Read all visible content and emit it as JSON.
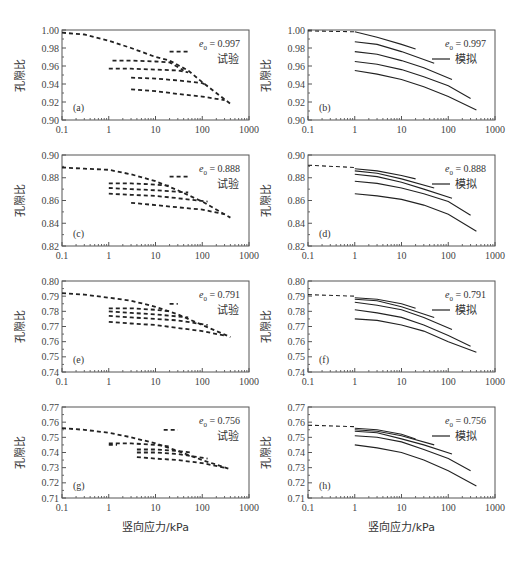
{
  "figure": {
    "x_axis_label": "竖向应力/kPa",
    "y_axis_label": "孔隙比"
  },
  "chart_data": [
    {
      "panel": "(a)",
      "type": "line",
      "style": "dashed",
      "legend": "试验",
      "e0_label": "e0 = 0.997",
      "xscale": "log",
      "xlim": [
        0.1,
        1000
      ],
      "xticks": [
        "0.1",
        "1",
        "10",
        "100",
        "1000"
      ],
      "ylim": [
        0.9,
        1.0
      ],
      "yticks": [
        "0.90",
        "0.92",
        "0.94",
        "0.96",
        "0.98",
        "1.00"
      ],
      "series": [
        {
          "name": "loading-0",
          "x": [
            0.1,
            0.3,
            1,
            3,
            10,
            20,
            50,
            100,
            200,
            400
          ],
          "y": [
            0.997,
            0.995,
            0.988,
            0.98,
            0.97,
            0.966,
            0.955,
            0.942,
            0.93,
            0.918
          ]
        },
        {
          "name": "reload-1",
          "x": [
            20,
            30,
            50
          ],
          "y": [
            0.976,
            0.976,
            0.976
          ]
        },
        {
          "name": "reload-2",
          "x": [
            1.2,
            3,
            10,
            20,
            40
          ],
          "y": [
            0.966,
            0.966,
            0.965,
            0.964,
            0.955
          ]
        },
        {
          "name": "reload-3",
          "x": [
            1,
            3,
            10,
            30,
            50
          ],
          "y": [
            0.957,
            0.957,
            0.956,
            0.955,
            0.953
          ]
        },
        {
          "name": "reload-4",
          "x": [
            3,
            10,
            30,
            100,
            130
          ],
          "y": [
            0.947,
            0.946,
            0.944,
            0.941,
            0.938
          ]
        },
        {
          "name": "reload-5",
          "x": [
            3,
            10,
            30,
            100,
            300
          ],
          "y": [
            0.934,
            0.932,
            0.929,
            0.926,
            0.922
          ]
        }
      ]
    },
    {
      "panel": "(b)",
      "type": "line",
      "style": "solid",
      "legend": "模拟",
      "e0_label": "e0 = 0.997",
      "xscale": "log",
      "xlim": [
        0.1,
        1000
      ],
      "ylim": [
        0.9,
        1.0
      ],
      "series": [
        {
          "name": "init",
          "x": [
            0.1,
            1
          ],
          "y": [
            0.999,
            0.998
          ]
        },
        {
          "name": "cycle-1",
          "x": [
            1,
            3,
            10,
            20
          ],
          "y": [
            0.998,
            0.992,
            0.984,
            0.979
          ]
        },
        {
          "name": "cycle-2",
          "x": [
            1,
            3,
            10,
            50
          ],
          "y": [
            0.987,
            0.984,
            0.976,
            0.963
          ]
        },
        {
          "name": "cycle-3",
          "x": [
            1,
            3,
            10,
            30,
            120
          ],
          "y": [
            0.976,
            0.973,
            0.966,
            0.958,
            0.945
          ]
        },
        {
          "name": "cycle-4",
          "x": [
            1,
            3,
            10,
            30,
            100,
            300
          ],
          "y": [
            0.965,
            0.962,
            0.956,
            0.948,
            0.938,
            0.924
          ]
        },
        {
          "name": "cycle-5",
          "x": [
            1,
            3,
            10,
            30,
            100,
            400
          ],
          "y": [
            0.955,
            0.951,
            0.945,
            0.937,
            0.926,
            0.911
          ]
        }
      ]
    },
    {
      "panel": "(c)",
      "type": "line",
      "style": "dashed",
      "legend": "试验",
      "e0_label": "e0 = 0.888",
      "xscale": "log",
      "xlim": [
        0.1,
        1000
      ],
      "ylim": [
        0.82,
        0.9
      ],
      "yticks": [
        "0.82",
        "0.84",
        "0.86",
        "0.88",
        "0.90"
      ],
      "series": [
        {
          "name": "loading-0",
          "x": [
            0.1,
            0.3,
            1,
            3,
            10,
            30,
            100,
            400
          ],
          "y": [
            0.889,
            0.888,
            0.887,
            0.883,
            0.877,
            0.869,
            0.859,
            0.845
          ]
        },
        {
          "name": "reload-1",
          "x": [
            20,
            30,
            50
          ],
          "y": [
            0.881,
            0.881,
            0.881
          ]
        },
        {
          "name": "reload-2",
          "x": [
            1,
            3,
            10,
            20
          ],
          "y": [
            0.875,
            0.875,
            0.874,
            0.873
          ]
        },
        {
          "name": "reload-3",
          "x": [
            1,
            3,
            10,
            50
          ],
          "y": [
            0.871,
            0.87,
            0.869,
            0.867
          ]
        },
        {
          "name": "reload-4",
          "x": [
            1,
            3,
            10,
            30,
            130
          ],
          "y": [
            0.866,
            0.865,
            0.864,
            0.862,
            0.859
          ]
        },
        {
          "name": "reload-5",
          "x": [
            3,
            10,
            30,
            100,
            300
          ],
          "y": [
            0.858,
            0.856,
            0.854,
            0.852,
            0.848
          ]
        }
      ]
    },
    {
      "panel": "(d)",
      "type": "line",
      "style": "solid",
      "legend": "模拟",
      "e0_label": "e0 = 0.888",
      "xscale": "log",
      "xlim": [
        0.1,
        1000
      ],
      "ylim": [
        0.82,
        0.9
      ],
      "series": [
        {
          "name": "init",
          "x": [
            0.1,
            1
          ],
          "y": [
            0.891,
            0.889
          ]
        },
        {
          "name": "cycle-1",
          "x": [
            1,
            3,
            10,
            20
          ],
          "y": [
            0.888,
            0.886,
            0.882,
            0.879
          ]
        },
        {
          "name": "cycle-2",
          "x": [
            1,
            3,
            10,
            50
          ],
          "y": [
            0.886,
            0.884,
            0.879,
            0.871
          ]
        },
        {
          "name": "cycle-3",
          "x": [
            1,
            3,
            10,
            30,
            120
          ],
          "y": [
            0.883,
            0.881,
            0.876,
            0.87,
            0.862
          ]
        },
        {
          "name": "cycle-4",
          "x": [
            1,
            3,
            10,
            30,
            100,
            300
          ],
          "y": [
            0.877,
            0.875,
            0.871,
            0.866,
            0.859,
            0.847
          ]
        },
        {
          "name": "cycle-5",
          "x": [
            1,
            3,
            10,
            30,
            100,
            400
          ],
          "y": [
            0.866,
            0.864,
            0.861,
            0.856,
            0.848,
            0.833
          ]
        }
      ]
    },
    {
      "panel": "(e)",
      "type": "line",
      "style": "dashed",
      "legend": "试验",
      "e0_label": "e0 = 0.791",
      "xscale": "log",
      "xlim": [
        0.1,
        1000
      ],
      "ylim": [
        0.74,
        0.8
      ],
      "yticks": [
        "0.74",
        "0.75",
        "0.76",
        "0.77",
        "0.78",
        "0.79",
        "0.80"
      ],
      "series": [
        {
          "name": "loading-0",
          "x": [
            0.1,
            0.3,
            1,
            3,
            10,
            30,
            100,
            400
          ],
          "y": [
            0.792,
            0.791,
            0.789,
            0.787,
            0.783,
            0.778,
            0.771,
            0.763
          ]
        },
        {
          "name": "reload-1",
          "x": [
            20,
            30
          ],
          "y": [
            0.785,
            0.785
          ]
        },
        {
          "name": "reload-2",
          "x": [
            1,
            3,
            10,
            20
          ],
          "y": [
            0.782,
            0.782,
            0.781,
            0.78
          ]
        },
        {
          "name": "reload-3",
          "x": [
            1,
            3,
            10,
            50
          ],
          "y": [
            0.78,
            0.779,
            0.778,
            0.776
          ]
        },
        {
          "name": "reload-4",
          "x": [
            1,
            3,
            10,
            30,
            130
          ],
          "y": [
            0.777,
            0.776,
            0.775,
            0.774,
            0.771
          ]
        },
        {
          "name": "reload-5",
          "x": [
            1,
            3,
            10,
            30,
            100,
            300
          ],
          "y": [
            0.773,
            0.772,
            0.771,
            0.769,
            0.767,
            0.764
          ]
        }
      ]
    },
    {
      "panel": "(f)",
      "type": "line",
      "style": "solid",
      "legend": "模拟",
      "e0_label": "e0 = 0.791",
      "xscale": "log",
      "xlim": [
        0.1,
        1000
      ],
      "ylim": [
        0.74,
        0.8
      ],
      "series": [
        {
          "name": "init",
          "x": [
            0.1,
            1
          ],
          "y": [
            0.791,
            0.79
          ]
        },
        {
          "name": "cycle-1",
          "x": [
            1,
            3,
            10,
            20
          ],
          "y": [
            0.789,
            0.788,
            0.785,
            0.782
          ]
        },
        {
          "name": "cycle-2",
          "x": [
            1,
            3,
            10,
            50
          ],
          "y": [
            0.788,
            0.787,
            0.783,
            0.776
          ]
        },
        {
          "name": "cycle-3",
          "x": [
            1,
            3,
            10,
            30,
            120
          ],
          "y": [
            0.786,
            0.784,
            0.781,
            0.776,
            0.768
          ]
        },
        {
          "name": "cycle-4",
          "x": [
            1,
            3,
            10,
            30,
            100,
            300
          ],
          "y": [
            0.781,
            0.779,
            0.776,
            0.771,
            0.764,
            0.757
          ]
        },
        {
          "name": "cycle-5",
          "x": [
            1,
            3,
            10,
            30,
            100,
            400
          ],
          "y": [
            0.775,
            0.774,
            0.771,
            0.767,
            0.76,
            0.753
          ]
        }
      ]
    },
    {
      "panel": "(g)",
      "type": "line",
      "style": "dashed",
      "legend": "试验",
      "e0_label": "e0 = 0.756",
      "xscale": "log",
      "xlim": [
        0.1,
        1000
      ],
      "ylim": [
        0.71,
        0.77
      ],
      "yticks": [
        "0.71",
        "0.72",
        "0.73",
        "0.74",
        "0.75",
        "0.76",
        "0.77"
      ],
      "series": [
        {
          "name": "loading-0",
          "x": [
            0.1,
            0.3,
            1,
            3,
            10,
            30,
            100,
            400
          ],
          "y": [
            0.756,
            0.755,
            0.753,
            0.75,
            0.746,
            0.741,
            0.735,
            0.729
          ]
        },
        {
          "name": "reload-1",
          "x": [
            15,
            30
          ],
          "y": [
            0.755,
            0.755
          ]
        },
        {
          "name": "reload-2",
          "x": [
            1,
            3,
            10,
            20
          ],
          "y": [
            0.746,
            0.746,
            0.745,
            0.744
          ]
        },
        {
          "name": "reload-3",
          "x": [
            1,
            1.5
          ],
          "y": [
            0.745,
            0.745
          ]
        },
        {
          "name": "reload-4",
          "x": [
            4,
            10,
            30,
            60
          ],
          "y": [
            0.742,
            0.742,
            0.741,
            0.74
          ]
        },
        {
          "name": "reload-5",
          "x": [
            4,
            10,
            30,
            130
          ],
          "y": [
            0.74,
            0.74,
            0.739,
            0.736
          ]
        },
        {
          "name": "reload-6",
          "x": [
            4,
            10,
            30,
            100,
            300
          ],
          "y": [
            0.737,
            0.736,
            0.735,
            0.733,
            0.73
          ]
        }
      ]
    },
    {
      "panel": "(h)",
      "type": "line",
      "style": "solid",
      "legend": "模拟",
      "e0_label": "e0 = 0.756",
      "xscale": "log",
      "xlim": [
        0.1,
        1000
      ],
      "ylim": [
        0.71,
        0.77
      ],
      "series": [
        {
          "name": "init",
          "x": [
            0.1,
            1
          ],
          "y": [
            0.758,
            0.757
          ]
        },
        {
          "name": "cycle-1",
          "x": [
            1,
            3,
            10,
            20
          ],
          "y": [
            0.756,
            0.755,
            0.752,
            0.749
          ]
        },
        {
          "name": "cycle-2",
          "x": [
            1,
            3,
            10,
            50
          ],
          "y": [
            0.755,
            0.754,
            0.751,
            0.745
          ]
        },
        {
          "name": "cycle-3",
          "x": [
            1,
            3,
            10,
            30,
            120
          ],
          "y": [
            0.754,
            0.753,
            0.749,
            0.745,
            0.739
          ]
        },
        {
          "name": "cycle-4",
          "x": [
            1,
            3,
            10,
            30,
            100,
            300
          ],
          "y": [
            0.751,
            0.75,
            0.747,
            0.742,
            0.736,
            0.728
          ]
        },
        {
          "name": "cycle-5",
          "x": [
            1,
            3,
            10,
            30,
            100,
            400
          ],
          "y": [
            0.745,
            0.743,
            0.74,
            0.735,
            0.728,
            0.718
          ]
        }
      ]
    }
  ]
}
